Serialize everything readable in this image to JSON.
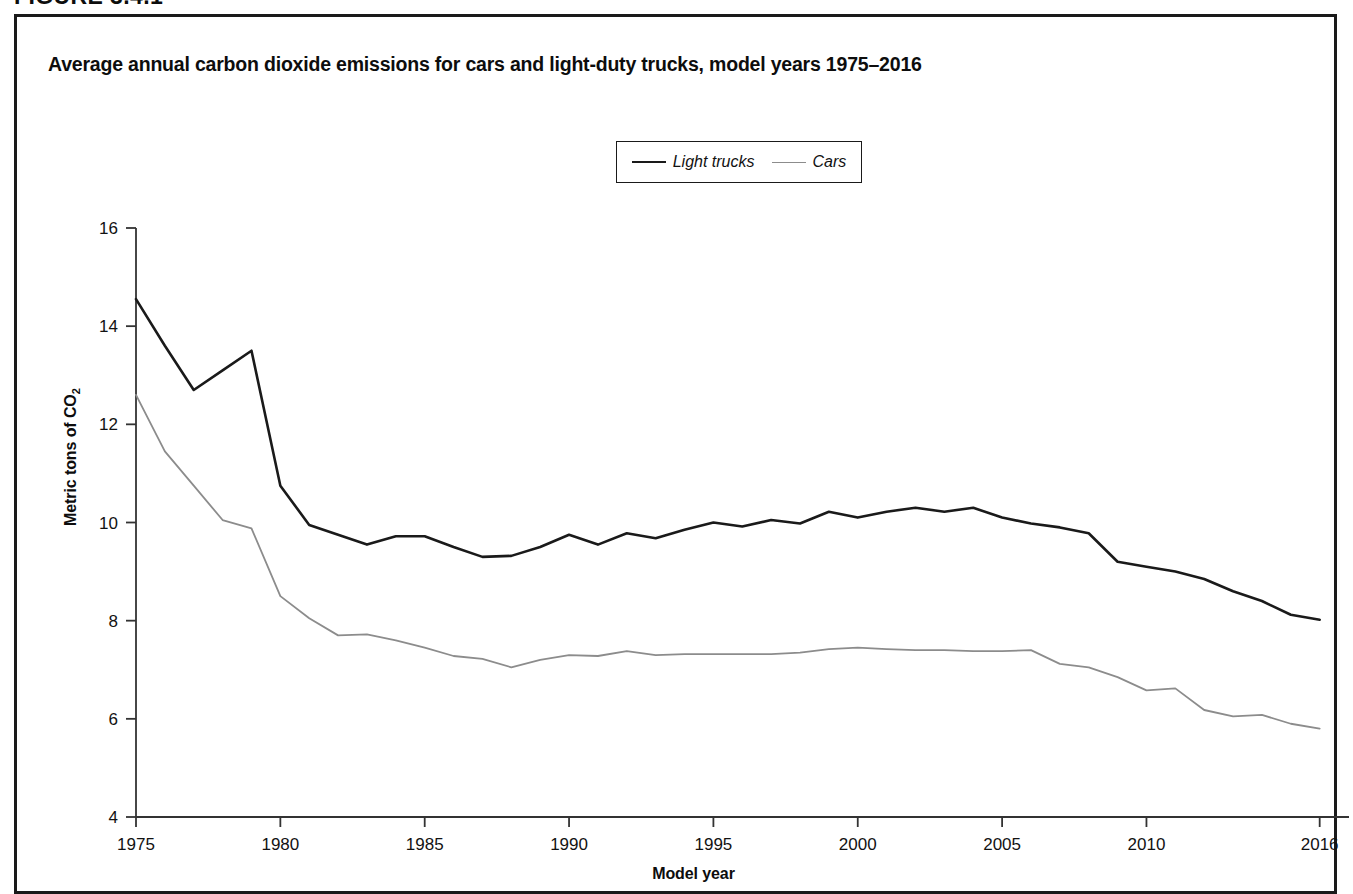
{
  "figure": {
    "number_label": "FIGURE 3.4.1"
  },
  "chart_title": "Average annual carbon dioxide emissions for cars and light-duty trucks, model years 1975–2016",
  "axis_titles": {
    "x": "Model year",
    "y_prefix": "Metric tons of CO",
    "y_subscript": "2"
  },
  "legend": {
    "entries": [
      {
        "label": "Light trucks",
        "color": "#1a1a1a",
        "width": 2.6
      },
      {
        "label": "Cars",
        "color": "#8c8c8c",
        "width": 1.8
      }
    ]
  },
  "chart_data": {
    "type": "line",
    "title": "Average annual carbon dioxide emissions for cars and light-duty trucks, model years 1975–2016",
    "xlabel": "Model year",
    "ylabel": "Metric tons of CO2",
    "xlim": [
      1975,
      2016.6
    ],
    "ylim": [
      4,
      16
    ],
    "yticks": [
      4,
      6,
      8,
      10,
      12,
      14,
      16
    ],
    "xticks": [
      1975,
      1980,
      1985,
      1990,
      1995,
      2000,
      2005,
      2010,
      2016
    ],
    "xtick_labels": [
      "1975",
      "1980",
      "1985",
      "1990",
      "1995",
      "2000",
      "2005",
      "2010",
      "2016"
    ],
    "ytick_labels": [
      "4",
      "6",
      "8",
      "10",
      "12",
      "14",
      "16"
    ],
    "grid": false,
    "legend_position": "top-center",
    "x": [
      1975,
      1976,
      1977,
      1978,
      1979,
      1980,
      1981,
      1982,
      1983,
      1984,
      1985,
      1986,
      1987,
      1988,
      1989,
      1990,
      1991,
      1992,
      1993,
      1994,
      1995,
      1996,
      1997,
      1998,
      1999,
      2000,
      2001,
      2002,
      2003,
      2004,
      2005,
      2006,
      2007,
      2008,
      2009,
      2010,
      2011,
      2012,
      2013,
      2014,
      2015,
      2016
    ],
    "series": [
      {
        "name": "Light trucks",
        "color": "#1a1a1a",
        "values": [
          14.55,
          13.6,
          12.7,
          13.1,
          13.5,
          10.75,
          9.95,
          9.75,
          9.55,
          9.72,
          9.72,
          9.5,
          9.3,
          9.32,
          9.5,
          9.75,
          9.55,
          9.78,
          9.68,
          9.85,
          10.0,
          9.92,
          10.05,
          9.98,
          10.22,
          10.1,
          10.22,
          10.3,
          10.22,
          10.3,
          10.1,
          9.98,
          9.9,
          9.78,
          9.2,
          9.1,
          9.0,
          8.85,
          8.6,
          8.4,
          8.12,
          8.02
        ]
      },
      {
        "name": "Cars",
        "color": "#8c8c8c",
        "values": [
          12.6,
          11.45,
          10.75,
          10.05,
          9.88,
          8.5,
          8.05,
          7.7,
          7.72,
          7.6,
          7.45,
          7.28,
          7.22,
          7.05,
          7.2,
          7.3,
          7.28,
          7.38,
          7.3,
          7.32,
          7.32,
          7.32,
          7.32,
          7.35,
          7.42,
          7.45,
          7.42,
          7.4,
          7.4,
          7.38,
          7.38,
          7.4,
          7.12,
          7.05,
          6.85,
          6.58,
          6.62,
          6.18,
          6.05,
          6.08,
          5.9,
          5.8
        ]
      }
    ]
  }
}
